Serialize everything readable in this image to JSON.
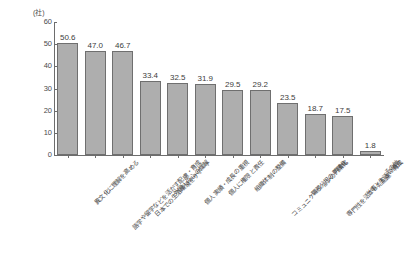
{
  "chart_data": {
    "type": "bar",
    "title": "",
    "subtitle": "",
    "xlabel": "",
    "ylabel": "",
    "unit_label": "(社)",
    "ylim": [
      0,
      60
    ],
    "yticks": [
      0,
      10,
      20,
      30,
      40,
      50,
      60
    ],
    "ytick_labels": [
      "0",
      "10",
      "20",
      "30",
      "40",
      "50",
      "60"
    ],
    "grid": false,
    "legend": false,
    "legend_position": "none",
    "bar_color": "#aeaeae",
    "bar_border_color": "#6f6f6f",
    "axis_color": "#6d6d6d",
    "text_color": "#454545",
    "categories": [
      "異文化に理解を高める",
      "語学や留学などを活かす配慮・育成",
      "日本での生活環境をサポート",
      "外国人の心の理解",
      "個人実績・成長の重視",
      "個人に権限と責任",
      "組織体制の整備",
      "コミュニケーションの円滑化",
      "職務分担の明確化",
      "専門性を活かした配慮・育成",
      "仕事と生活の両立",
      "その他"
    ],
    "values": [
      50.6,
      47.0,
      46.7,
      33.4,
      32.5,
      31.9,
      29.5,
      29.2,
      23.5,
      18.7,
      17.5,
      1.8
    ],
    "value_labels": [
      "50.6",
      "47.0",
      "46.7",
      "33.4",
      "32.5",
      "31.9",
      "29.5",
      "29.2",
      "23.5",
      "18.7",
      "17.5",
      "1.8"
    ]
  }
}
